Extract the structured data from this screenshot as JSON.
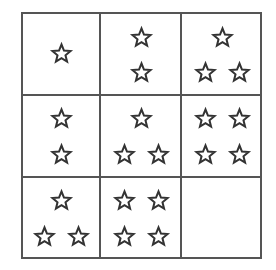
{
  "puzzle": {
    "rows": 3,
    "cols": 3,
    "star_color": "#333333",
    "line_color": "#555555",
    "cells": [
      {
        "row": 0,
        "col": 0,
        "count": 1,
        "stars": [
          [
            61,
            53
          ]
        ]
      },
      {
        "row": 0,
        "col": 1,
        "count": 2,
        "stars": [
          [
            141,
            37
          ],
          [
            141,
            72
          ]
        ]
      },
      {
        "row": 0,
        "col": 2,
        "count": 3,
        "stars": [
          [
            222,
            37
          ],
          [
            205,
            72
          ],
          [
            239,
            72
          ]
        ]
      },
      {
        "row": 1,
        "col": 0,
        "count": 2,
        "stars": [
          [
            61,
            118
          ],
          [
            61,
            154
          ]
        ]
      },
      {
        "row": 1,
        "col": 1,
        "count": 3,
        "stars": [
          [
            141,
            118
          ],
          [
            124,
            154
          ],
          [
            158,
            154
          ]
        ]
      },
      {
        "row": 1,
        "col": 2,
        "count": 4,
        "stars": [
          [
            205,
            118
          ],
          [
            239,
            118
          ],
          [
            205,
            154
          ],
          [
            239,
            154
          ]
        ]
      },
      {
        "row": 2,
        "col": 0,
        "count": 3,
        "stars": [
          [
            61,
            200
          ],
          [
            44,
            236
          ],
          [
            78,
            236
          ]
        ]
      },
      {
        "row": 2,
        "col": 1,
        "count": 4,
        "stars": [
          [
            124,
            200
          ],
          [
            158,
            200
          ],
          [
            124,
            236
          ],
          [
            158,
            236
          ]
        ]
      },
      {
        "row": 2,
        "col": 2,
        "count": 0,
        "stars": []
      }
    ]
  }
}
